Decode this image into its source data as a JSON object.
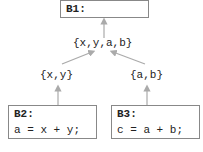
{
  "blocks": {
    "b1": {
      "label": "B1:"
    },
    "b2": {
      "label": "B2:",
      "code": "a = x + y;"
    },
    "b3": {
      "label": "B3:",
      "code": "c = a + b;"
    }
  },
  "sets": {
    "merged": "{x,y,a,b}",
    "left": "{x,y}",
    "right": "{a,b}"
  },
  "colors": {
    "border": "#888888",
    "arrow": "#aaaaaa",
    "text": "#222222"
  }
}
